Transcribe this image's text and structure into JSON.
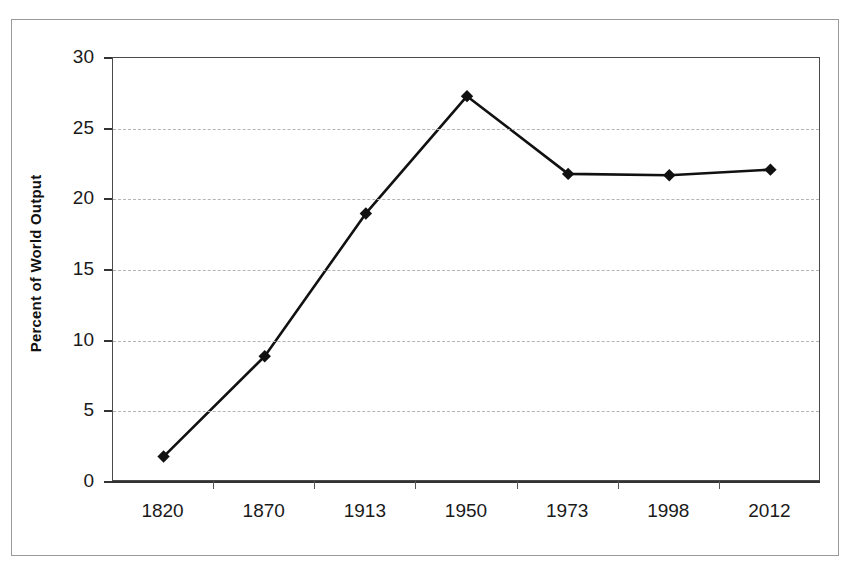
{
  "figure": {
    "background_color": "#ffffff",
    "frame_color": "#9a9a9a",
    "axis_color": "#333333",
    "grid_color": "#b4b4b4",
    "series_color": "#111111"
  },
  "chart_data": {
    "type": "line",
    "title": "",
    "xlabel": "",
    "ylabel": "Percent of World Output",
    "categories": [
      "1820",
      "1870",
      "1913",
      "1950",
      "1973",
      "1998",
      "2012"
    ],
    "values": [
      1.8,
      8.9,
      19.0,
      27.3,
      21.8,
      21.7,
      22.1
    ],
    "series": [
      {
        "name": "Percent of World Output",
        "values": [
          1.8,
          8.9,
          19.0,
          27.3,
          21.8,
          21.7,
          22.1
        ]
      }
    ],
    "ylim": [
      0,
      30
    ],
    "yticks": [
      0,
      5,
      10,
      15,
      20,
      25,
      30
    ],
    "ytick_labels": [
      "0",
      "5",
      "10",
      "15",
      "20",
      "25",
      "30"
    ],
    "grid": true,
    "grid_style": "dashed-horizontal",
    "legend": false,
    "legend_position": "none",
    "marker": "diamond",
    "annotations": []
  }
}
